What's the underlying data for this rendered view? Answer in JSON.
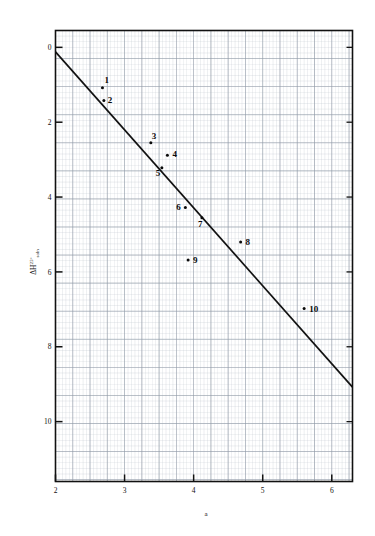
{
  "figure": {
    "background_color": "#ffffff",
    "grid_color": "#b9c2cc",
    "grid_major_color": "#8f9aa6",
    "frame_color": "#111111",
    "line_color": "#111111",
    "point_color": "#0a0a0a"
  },
  "chart_data": {
    "type": "scatter",
    "title": "",
    "subtitle": "",
    "xlabel": "a",
    "ylabel": "ΔH°soln",
    "ylabel_parts": {
      "delta_h": "ΔH",
      "superscript": "25",
      "degree": "°",
      "subscript": "soln"
    },
    "xlim": [
      2,
      6.3
    ],
    "ylim": [
      11.6,
      -0.45
    ],
    "y_inverted": true,
    "grid": true,
    "grid_minor_step_x": 0.05,
    "grid_minor_step_y": 0.15,
    "grid_major_every": 5,
    "legend": "none",
    "xticks": [
      2,
      3,
      4,
      5,
      6
    ],
    "xtick_labels": [
      "2",
      "3",
      "4",
      "5",
      "6"
    ],
    "yticks": [
      0,
      2,
      4,
      6,
      8,
      10
    ],
    "ytick_labels": [
      "0",
      "2",
      "4",
      "6",
      "8",
      "10"
    ],
    "points": [
      {
        "label": "1",
        "x": 2.68,
        "y": 1.08,
        "label_dx": 2,
        "label_dy": -5
      },
      {
        "label": "2",
        "x": 2.7,
        "y": 1.42,
        "label_dx": 4,
        "label_dy": 3
      },
      {
        "label": "3",
        "x": 3.38,
        "y": 2.55,
        "label_dx": 1,
        "label_dy": -4
      },
      {
        "label": "4",
        "x": 3.62,
        "y": 2.88,
        "label_dx": 5,
        "label_dy": 2
      },
      {
        "label": "5",
        "x": 3.54,
        "y": 3.22,
        "label_dx": -6,
        "label_dy": 8
      },
      {
        "label": "6",
        "x": 3.88,
        "y": 4.28,
        "label_dx": -9,
        "label_dy": 2
      },
      {
        "label": "7",
        "x": 4.12,
        "y": 4.55,
        "label_dx": -4,
        "label_dy": 9
      },
      {
        "label": "8",
        "x": 4.68,
        "y": 5.2,
        "label_dx": 5,
        "label_dy": 3
      },
      {
        "label": "9",
        "x": 3.92,
        "y": 5.68,
        "label_dx": 5,
        "label_dy": 3
      },
      {
        "label": "10",
        "x": 5.6,
        "y": 6.98,
        "label_dx": 5,
        "label_dy": 3
      }
    ],
    "trend_line": {
      "x_start": 2.0,
      "y_start": 0.12,
      "x_end": 6.3,
      "y_end": 9.08
    }
  }
}
